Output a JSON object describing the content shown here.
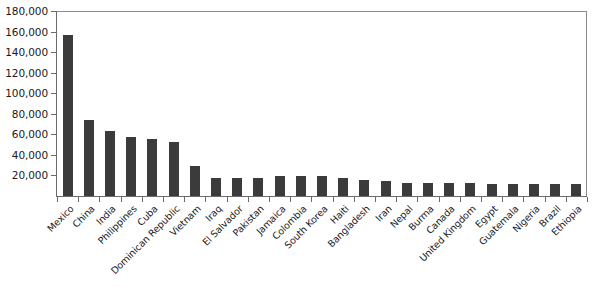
{
  "chart_data": {
    "type": "bar",
    "title": "",
    "subtitle": "",
    "xlabel": "",
    "ylabel": "",
    "ylim": [
      0,
      180000
    ],
    "ytick_step": 20000,
    "grid": false,
    "legend": null,
    "bar_color": "#3b3b3b",
    "axis_color": "#6b6b6b",
    "frame_color": "#8c8c8c",
    "background_color": "#ffffff",
    "label_rotation_degrees": -45,
    "ytick_labels": [
      "180,000",
      "160,000",
      "140,000",
      "120,000",
      "100,000",
      "80,000",
      "60,000",
      "40,000",
      "20,000"
    ],
    "ytick_values": [
      180000,
      160000,
      140000,
      120000,
      100000,
      80000,
      60000,
      40000,
      20000
    ],
    "categories": [
      "Mexico",
      "China",
      "India",
      "Philippines",
      "Cuba",
      "Dominican Republic",
      "Vietnam",
      "Iraq",
      "El Salvador",
      "Pakistan",
      "Jamaica",
      "Colombia",
      "South Korea",
      "Haiti",
      "Bangladesh",
      "Iran",
      "Nepal",
      "Burma",
      "Canada",
      "United Kingdom",
      "Egypt",
      "Guatemala",
      "Nigeria",
      "Brazil",
      "Ethiopia"
    ],
    "values": [
      157000,
      74000,
      63000,
      57000,
      55000,
      53000,
      29000,
      18000,
      18000,
      18000,
      19000,
      19000,
      19000,
      18000,
      16000,
      15000,
      13000,
      13000,
      13000,
      13000,
      12000,
      12000,
      12000,
      12000,
      12000
    ]
  }
}
